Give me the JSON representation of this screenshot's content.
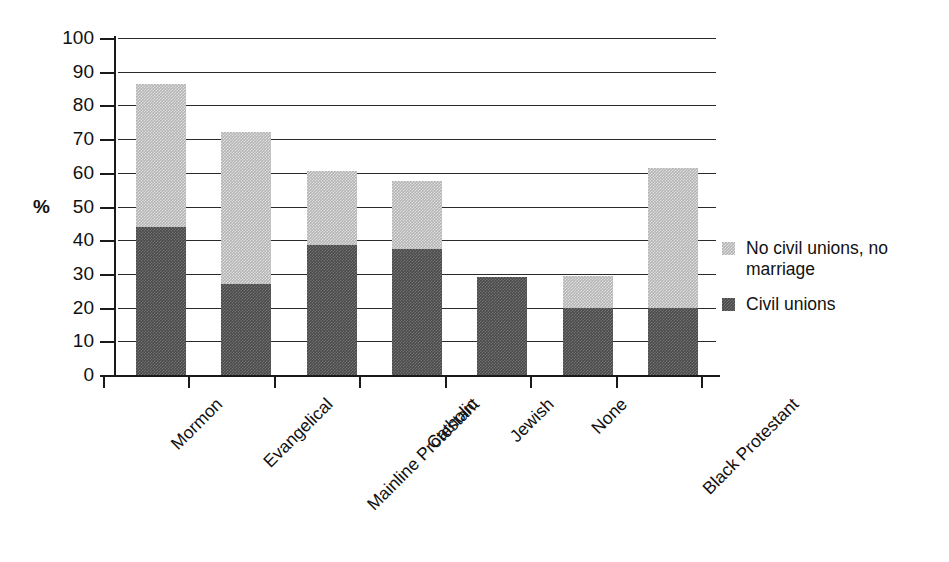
{
  "chart_data": {
    "type": "bar",
    "subtype": "stacked-vertical",
    "title": "",
    "xlabel": "",
    "ylabel": "%",
    "ylim": [
      0,
      100
    ],
    "ytick_labels": [
      "100",
      "90",
      "80",
      "70",
      "60",
      "50",
      "40",
      "30",
      "20",
      "10",
      "0"
    ],
    "ytick_values": [
      100,
      90,
      80,
      70,
      60,
      50,
      40,
      30,
      20,
      10,
      0
    ],
    "grid": true,
    "grid_axis": "y",
    "legend_position": "right",
    "categories": [
      "Mormon",
      "Evangelical",
      "Mainline Protestant",
      "Catholic",
      "Jewish",
      "None",
      "Black Protestant"
    ],
    "series": [
      {
        "name": "Civil unions",
        "color": "#4a4a4a",
        "values": [
          44,
          27,
          38.5,
          37.5,
          29,
          20,
          20
        ]
      },
      {
        "name": "No civil unions, no marriage",
        "color": "#b4b4b4",
        "values": [
          42.5,
          45,
          22,
          20,
          0,
          9.5,
          41.5
        ]
      }
    ],
    "totals": [
      86.5,
      72,
      60.5,
      57.5,
      29,
      29.5,
      61.5
    ]
  },
  "legend": {
    "items": [
      {
        "label": "No civil unions, no marriage",
        "swatch": "#b4b4b4",
        "series": "no-civil-unions-no-marriage"
      },
      {
        "label": "Civil unions",
        "swatch": "#4a4a4a",
        "series": "civil-unions"
      }
    ]
  },
  "axes": {
    "y_title": "%"
  }
}
